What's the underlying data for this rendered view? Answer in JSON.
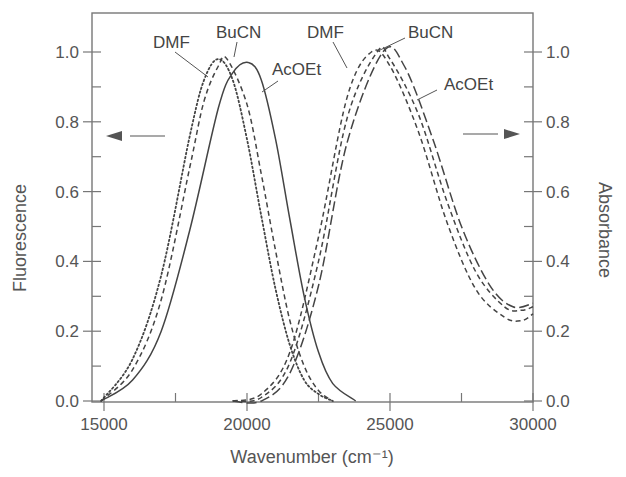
{
  "chart_data": {
    "type": "line",
    "title": "",
    "xlabel": "Wavenumber (cm⁻¹)",
    "ylabel_left": "Fluorescence",
    "ylabel_right": "Absorbance",
    "xlim": [
      14700,
      30000
    ],
    "ylim": [
      0.0,
      1.1
    ],
    "x_ticks": [
      15000,
      20000,
      25000,
      30000
    ],
    "x_tick_labels": [
      "15000",
      "20000",
      "25000",
      "30000"
    ],
    "x_minor_ticks": [
      17500,
      22500,
      27500
    ],
    "y_ticks": [
      0.0,
      0.2,
      0.4,
      0.6,
      0.8,
      1.0
    ],
    "y_tick_labels": [
      "0.0",
      "0.2",
      "0.4",
      "0.6",
      "0.8",
      "1.0"
    ],
    "y_minor_ticks": [
      0.1,
      0.3,
      0.5,
      0.7,
      0.9
    ],
    "grid": false,
    "legend": "inline annotations",
    "series": [
      {
        "name": "DMF",
        "group": "fluorescence",
        "style": "dotted",
        "axis": "left",
        "peak_x": 19000,
        "peak_y": 0.98,
        "width_low": 1650,
        "width_high": 1150,
        "x": [
          14900,
          16000,
          17000,
          18000,
          18500,
          19000,
          19500,
          20000,
          20500,
          21000,
          21500,
          22000,
          22500,
          23000
        ],
        "values": [
          0.0,
          0.12,
          0.36,
          0.76,
          0.92,
          0.98,
          0.92,
          0.75,
          0.53,
          0.32,
          0.16,
          0.06,
          0.02,
          0.0
        ]
      },
      {
        "name": "BuCN",
        "group": "fluorescence",
        "style": "dashed",
        "axis": "left",
        "peak_x": 19300,
        "peak_y": 0.98,
        "width_low": 1650,
        "width_high": 1150,
        "x": [
          14900,
          16000,
          17000,
          18000,
          18500,
          19000,
          19300,
          20000,
          20500,
          21000,
          21500,
          22000,
          22500,
          23000
        ],
        "values": [
          0.0,
          0.09,
          0.29,
          0.67,
          0.86,
          0.96,
          0.98,
          0.85,
          0.65,
          0.43,
          0.23,
          0.1,
          0.03,
          0.0
        ]
      },
      {
        "name": "AcOEt",
        "group": "fluorescence",
        "style": "solid",
        "axis": "left",
        "peak_x": 20050,
        "peak_y": 0.97,
        "width_low": 1750,
        "width_high": 1150,
        "x": [
          14900,
          16000,
          17000,
          18000,
          19000,
          19500,
          20050,
          20500,
          21000,
          21500,
          22000,
          22500,
          23000,
          23800
        ],
        "values": [
          0.0,
          0.06,
          0.2,
          0.49,
          0.84,
          0.94,
          0.97,
          0.92,
          0.75,
          0.52,
          0.3,
          0.14,
          0.05,
          0.0
        ]
      },
      {
        "name": "DMF",
        "group": "absorbance",
        "style": "dashed",
        "axis": "right",
        "peak_x": 24350,
        "peak_y": 1.0,
        "width_low": 1300,
        "width_high": 2000,
        "x": [
          19500,
          20500,
          21500,
          22500,
          23500,
          24350,
          25000,
          26000,
          27000,
          28000,
          29000,
          29600,
          30000
        ],
        "values": [
          0.0,
          0.02,
          0.14,
          0.47,
          0.87,
          1.0,
          0.96,
          0.77,
          0.51,
          0.32,
          0.24,
          0.23,
          0.25
        ]
      },
      {
        "name": "BuCN",
        "group": "absorbance",
        "style": "dashed",
        "axis": "right",
        "peak_x": 24550,
        "peak_y": 1.0,
        "width_low": 1300,
        "width_high": 2000,
        "x": [
          19500,
          20500,
          21500,
          22500,
          23500,
          24550,
          25000,
          26000,
          27000,
          28000,
          29000,
          29600,
          30000
        ],
        "values": [
          0.0,
          0.01,
          0.11,
          0.4,
          0.81,
          1.0,
          0.98,
          0.82,
          0.57,
          0.37,
          0.27,
          0.26,
          0.27
        ]
      },
      {
        "name": "AcOEt",
        "group": "absorbance",
        "style": "long-dashed",
        "axis": "right",
        "peak_x": 24750,
        "peak_y": 1.0,
        "width_low": 1300,
        "width_high": 2000,
        "x": [
          19500,
          20500,
          21500,
          22500,
          23500,
          24750,
          25500,
          26500,
          27500,
          28500,
          29300,
          30000
        ],
        "values": [
          0.0,
          0.0,
          0.08,
          0.33,
          0.74,
          1.0,
          0.96,
          0.75,
          0.5,
          0.33,
          0.27,
          0.28
        ]
      }
    ],
    "annotations": [
      {
        "text": "DMF",
        "target": "fluorescence DMF"
      },
      {
        "text": "BuCN",
        "target": "fluorescence BuCN"
      },
      {
        "text": "AcOEt",
        "target": "fluorescence AcOEt"
      },
      {
        "text": "DMF",
        "target": "absorbance DMF"
      },
      {
        "text": "BuCN",
        "target": "absorbance BuCN"
      },
      {
        "text": "AcOEt",
        "target": "absorbance AcOEt"
      },
      {
        "text": "←",
        "meaning": "left arrow pointing to Fluorescence axis"
      },
      {
        "text": "→",
        "meaning": "right arrow pointing to Absorbance axis"
      }
    ]
  },
  "labels": {
    "xlabel": "Wavenumber (cm⁻¹)",
    "ylabel_left": "Fluorescence",
    "ylabel_right": "Absorbance",
    "fl_dmf": "DMF",
    "fl_bucn": "BuCN",
    "fl_acoet": "AcOEt",
    "ab_dmf": "DMF",
    "ab_bucn": "BuCN",
    "ab_acoet": "AcOEt"
  },
  "colors": {
    "axis": "#666666",
    "curve": "#444444",
    "text": "#555555"
  }
}
